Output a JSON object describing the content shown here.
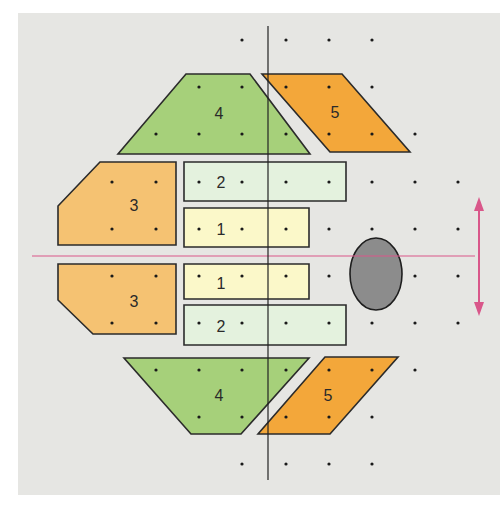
{
  "diagram": {
    "title": "",
    "colors": {
      "background": "#e6e6e3",
      "grid_dot": "#1a1a1a",
      "outline": "#2b2b2b",
      "green": "#a6d07a",
      "orange_light": "#f5c272",
      "orange": "#f3a73a",
      "pale_green": "#e4f2de",
      "pale_yellow": "#fbf8c9",
      "ellipse": "#8c8c8c",
      "axis_pink": "#d9578a",
      "axis_black": "#222222"
    },
    "shapes": [
      {
        "id": "shape-4-top",
        "label": "4",
        "kind": "trapezoid",
        "color": "green"
      },
      {
        "id": "shape-5-top",
        "label": "5",
        "kind": "parallelogram",
        "color": "orange"
      },
      {
        "id": "shape-3-top",
        "label": "3",
        "kind": "pentagon",
        "color": "orange_light"
      },
      {
        "id": "shape-2-top",
        "label": "2",
        "kind": "rectangle",
        "color": "pale_green"
      },
      {
        "id": "shape-1-top",
        "label": "1",
        "kind": "rectangle",
        "color": "pale_yellow"
      },
      {
        "id": "shape-1-bottom",
        "label": "1",
        "kind": "rectangle",
        "color": "pale_yellow"
      },
      {
        "id": "shape-2-bottom",
        "label": "2",
        "kind": "rectangle",
        "color": "pale_green"
      },
      {
        "id": "shape-3-bottom",
        "label": "3",
        "kind": "pentagon",
        "color": "orange_light"
      },
      {
        "id": "shape-4-bottom",
        "label": "4",
        "kind": "trapezoid",
        "color": "green"
      },
      {
        "id": "shape-5-bottom",
        "label": "5",
        "kind": "parallelogram",
        "color": "orange"
      }
    ],
    "ellipse": {
      "label": "",
      "color": "ellipse"
    },
    "symmetry_line_horizontal": {
      "color": "axis_pink"
    },
    "symmetry_line_vertical": {
      "color": "axis_black"
    },
    "double_arrow": {
      "direction": "vertical",
      "color": "axis_pink"
    }
  }
}
